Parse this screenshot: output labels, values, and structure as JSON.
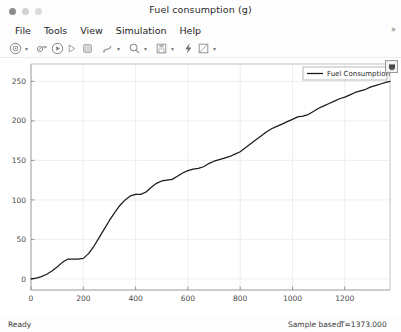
{
  "window": {
    "title": "Fuel consumption (g)",
    "traffic_lights": [
      "close",
      "minimize",
      "zoom"
    ]
  },
  "menubar": {
    "items": [
      {
        "label": "File",
        "name": "menu-file"
      },
      {
        "label": "Tools",
        "name": "menu-tools"
      },
      {
        "label": "View",
        "name": "menu-view"
      },
      {
        "label": "Simulation",
        "name": "menu-simulation"
      },
      {
        "label": "Help",
        "name": "menu-help"
      }
    ],
    "overflow_label": "»"
  },
  "toolbar": {
    "buttons": [
      {
        "name": "print-icon",
        "tooltip": "Print"
      },
      {
        "name": "print-dropdown-caret",
        "tooltip": "Print options"
      },
      {
        "name": "configuration-parameters-icon",
        "tooltip": "Configuration Parameters"
      },
      {
        "name": "run-icon",
        "tooltip": "Run"
      },
      {
        "name": "step-forward-icon",
        "tooltip": "Step Forward"
      },
      {
        "name": "stop-icon",
        "tooltip": "Stop"
      },
      {
        "name": "data-cursor-icon",
        "tooltip": "Cursor Measurements"
      },
      {
        "name": "data-cursor-dropdown-caret",
        "tooltip": "Cursor options"
      },
      {
        "name": "zoom-icon",
        "tooltip": "Zoom"
      },
      {
        "name": "zoom-dropdown-caret",
        "tooltip": "Zoom options"
      },
      {
        "name": "save-layout-icon",
        "tooltip": "Save"
      },
      {
        "name": "save-dropdown-caret",
        "tooltip": "Save options"
      },
      {
        "name": "highlight-signal-icon",
        "tooltip": "Highlight Signal to Source"
      },
      {
        "name": "styles-icon",
        "tooltip": "Styles"
      },
      {
        "name": "styles-dropdown-caret",
        "tooltip": "Style options"
      }
    ]
  },
  "plot": {
    "legend_label": "Fuel Consumption",
    "line_color": "#1a1a1a",
    "axis_color": "#8c8c8c",
    "grid_color": "#e6e6e6",
    "background": "#ffffff",
    "corner_button_name": "maximize-axes-button"
  },
  "statusbar": {
    "ready_label": "Ready",
    "mode_label": "Sample based",
    "time_label": "T=1373.000"
  },
  "chart_data": {
    "type": "line",
    "title": "Fuel consumption (g)",
    "xlabel": "",
    "ylabel": "",
    "xlim": [
      0,
      1373
    ],
    "ylim": [
      -14,
      272
    ],
    "xticks": [
      0,
      200,
      400,
      600,
      800,
      1000,
      1200
    ],
    "yticks": [
      0,
      50,
      100,
      150,
      200,
      250
    ],
    "grid": true,
    "legend_position": "top-right",
    "series": [
      {
        "name": "Fuel Consumption",
        "color": "#1a1a1a",
        "x": [
          0,
          20,
          40,
          60,
          80,
          100,
          120,
          140,
          160,
          180,
          200,
          220,
          240,
          260,
          280,
          300,
          320,
          340,
          360,
          380,
          400,
          420,
          440,
          460,
          480,
          500,
          520,
          540,
          560,
          580,
          600,
          620,
          640,
          660,
          680,
          700,
          720,
          740,
          760,
          780,
          800,
          820,
          840,
          860,
          880,
          900,
          920,
          940,
          960,
          980,
          1000,
          1020,
          1040,
          1060,
          1080,
          1100,
          1120,
          1140,
          1160,
          1180,
          1200,
          1220,
          1240,
          1260,
          1280,
          1300,
          1320,
          1340,
          1360,
          1373
        ],
        "y": [
          0,
          1,
          3,
          6,
          10,
          15,
          21,
          25,
          25,
          25,
          26,
          32,
          41,
          52,
          63,
          74,
          84,
          93,
          100,
          105,
          107,
          107,
          110,
          116,
          121,
          124,
          125,
          126,
          130,
          134,
          137,
          139,
          140,
          142,
          146,
          149,
          151,
          153,
          155,
          158,
          161,
          166,
          171,
          176,
          181,
          186,
          190,
          193,
          196,
          199,
          202,
          205,
          206,
          208,
          212,
          216,
          219,
          222,
          225,
          228,
          230,
          233,
          236,
          238,
          240,
          243,
          245,
          247,
          249,
          250
        ]
      }
    ]
  }
}
